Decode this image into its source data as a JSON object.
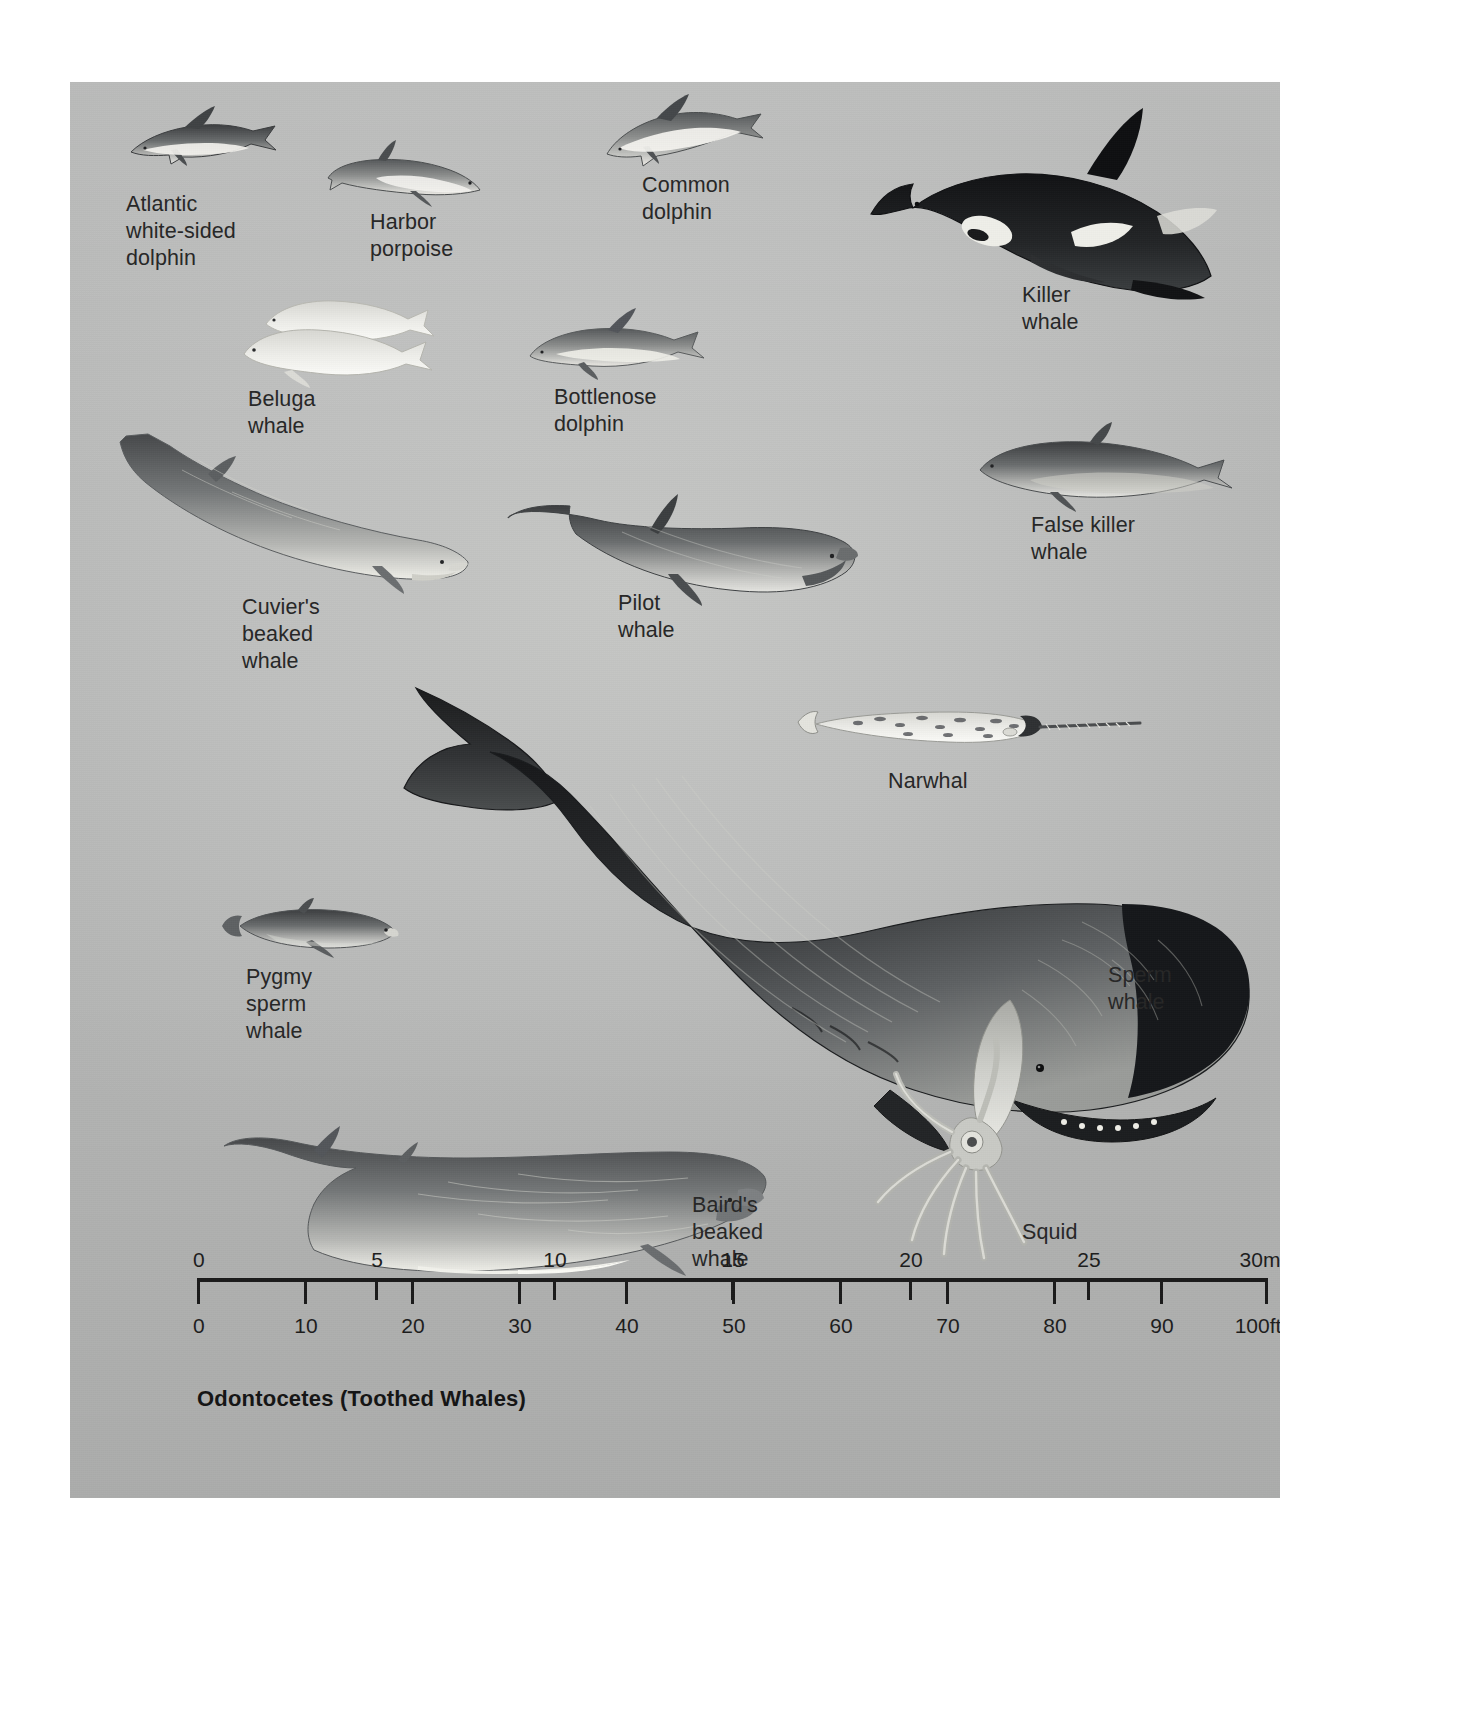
{
  "plate": {
    "caption": "Odontocetes (Toothed Whales)",
    "background_color": "#bfc0bf",
    "page_background": "#ffffff",
    "ink_color": "#262626"
  },
  "species": [
    {
      "key": "atlantic-white-sided-dolphin",
      "label": "Atlantic\nwhite-sided\ndolphin"
    },
    {
      "key": "harbor-porpoise",
      "label": "Harbor\nporpoise"
    },
    {
      "key": "common-dolphin",
      "label": "Common\ndolphin"
    },
    {
      "key": "killer-whale",
      "label": "Killer\nwhale"
    },
    {
      "key": "beluga-whale",
      "label": "Beluga\nwhale"
    },
    {
      "key": "bottlenose-dolphin",
      "label": "Bottlenose\ndolphin"
    },
    {
      "key": "false-killer-whale",
      "label": "False killer\nwhale"
    },
    {
      "key": "cuviers-beaked-whale",
      "label": "Cuvier's\nbeaked\nwhale"
    },
    {
      "key": "pilot-whale",
      "label": "Pilot\nwhale"
    },
    {
      "key": "narwhal",
      "label": "Narwhal"
    },
    {
      "key": "pygmy-sperm-whale",
      "label": "Pygmy\nsperm\nwhale"
    },
    {
      "key": "sperm-whale",
      "label": "Sperm\nwhale"
    },
    {
      "key": "squid",
      "label": "Squid"
    },
    {
      "key": "bairds-beaked-whale",
      "label": "Baird's\nbeaked\nwhale"
    }
  ],
  "scale": {
    "metric": {
      "unit_suffix": "m",
      "ticks": [
        "0",
        "5",
        "10",
        "15",
        "20",
        "25",
        "30m"
      ],
      "values": [
        0,
        5,
        10,
        15,
        20,
        25,
        30
      ],
      "max": 30
    },
    "imperial": {
      "unit_suffix": "ft",
      "ticks": [
        "0",
        "10",
        "20",
        "30",
        "40",
        "50",
        "60",
        "70",
        "80",
        "90",
        "100ft"
      ],
      "values": [
        0,
        10,
        20,
        30,
        40,
        50,
        60,
        70,
        80,
        90,
        100
      ],
      "max": 100
    }
  },
  "chart_data": {
    "type": "bar",
    "title": "Odontocetes (Toothed Whales)",
    "subtitle": "Comparative body lengths of toothed whales drawn to a common scale",
    "xlabel": "Body length",
    "ylabel": "",
    "categories": [
      "Atlantic white-sided dolphin",
      "Harbor porpoise",
      "Common dolphin",
      "Killer whale",
      "Beluga whale",
      "Bottlenose dolphin",
      "False killer whale",
      "Cuvier's beaked whale",
      "Pilot whale",
      "Narwhal",
      "Pygmy sperm whale",
      "Sperm whale",
      "Squid",
      "Baird's beaked whale"
    ],
    "series": [
      {
        "name": "Length (m)",
        "units": "m",
        "values": [
          2.8,
          1.8,
          2.4,
          8.5,
          4.2,
          3.5,
          5.5,
          7.0,
          6.0,
          5.0,
          3.4,
          18.0,
          9.0,
          12.5
        ]
      },
      {
        "name": "Length (ft)",
        "units": "ft",
        "values": [
          9,
          6,
          8,
          28,
          14,
          11,
          18,
          23,
          20,
          16,
          11,
          59,
          30,
          41
        ]
      }
    ],
    "axis_metric": {
      "label": "metres",
      "ticks": [
        0,
        5,
        10,
        15,
        20,
        25,
        30
      ],
      "range": [
        0,
        30
      ]
    },
    "axis_imperial": {
      "label": "feet",
      "ticks": [
        0,
        10,
        20,
        30,
        40,
        50,
        60,
        70,
        80,
        90,
        100
      ],
      "range": [
        0,
        100
      ]
    },
    "grid": false,
    "legend": "none"
  }
}
